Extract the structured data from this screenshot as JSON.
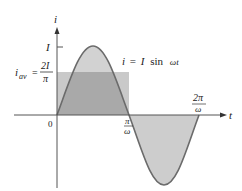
{
  "diagram": {
    "axes": {
      "y_label": "i",
      "x_label": "t",
      "origin_label": "0"
    },
    "y_ticks": [
      {
        "label": "I",
        "meaning": "peak current"
      }
    ],
    "average": {
      "lhs_main": "i",
      "lhs_sub": "av",
      "equals": "=",
      "numerator": "2I",
      "denominator": "π"
    },
    "x_ticks": [
      {
        "numerator": "π",
        "denominator": "ω"
      },
      {
        "numerator": "2π",
        "denominator": "ω"
      }
    ],
    "equation": {
      "lhs": "i",
      "equals": "=",
      "amp": "I",
      "func": "sin",
      "arg": "ωt"
    },
    "colors": {
      "curve": "#6b6b6b",
      "positive_fill": "#bdbdbd",
      "negative_fill": "#c8c8c8",
      "average_fill": "#a6a6a6",
      "average_rect": "#cfcfcf",
      "axis": "#555555"
    }
  }
}
